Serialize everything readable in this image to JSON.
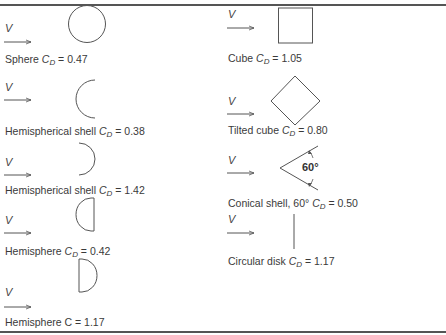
{
  "figure": {
    "velocity_symbol": "V",
    "left_column": [
      {
        "shape": "sphere",
        "name": "Sphere",
        "cd_symbol": "C",
        "cd_sub": "D",
        "value": "= 0.47"
      },
      {
        "shape": "hemispherical-shell-open-back",
        "name": "Hemispherical shell",
        "cd_symbol": "C",
        "cd_sub": "D",
        "value": "= 0.38"
      },
      {
        "shape": "hemispherical-shell-open-front",
        "name": "Hemispherical shell",
        "cd_symbol": "C",
        "cd_sub": "D",
        "value": "= 1.42"
      },
      {
        "shape": "hemisphere-round-front",
        "name": "Hemisphere",
        "cd_symbol": "C",
        "cd_sub": "D",
        "value": "= 0.42"
      },
      {
        "shape": "hemisphere-flat-front",
        "name": "Hemisphere",
        "cd_symbol": "C",
        "cd_sub": "",
        "value": "= 1.17"
      }
    ],
    "right_column": [
      {
        "shape": "cube",
        "name": "Cube",
        "cd_symbol": "C",
        "cd_sub": "D",
        "value": "= 1.05"
      },
      {
        "shape": "tilted-cube",
        "name": "Tilted cube",
        "cd_symbol": "C",
        "cd_sub": "D",
        "value": "= 0.80"
      },
      {
        "shape": "conical-shell",
        "name": "Conical shell, 60°",
        "cd_symbol": "C",
        "cd_sub": "D",
        "value": "= 0.50",
        "angle_label": "60°"
      },
      {
        "shape": "circular-disk",
        "name": "Circular disk",
        "cd_symbol": "C",
        "cd_sub": "D",
        "value": "= 1.17"
      }
    ]
  },
  "colors": {
    "stroke": "#555555",
    "text": "#3a3a3a",
    "rule": "#555555"
  }
}
